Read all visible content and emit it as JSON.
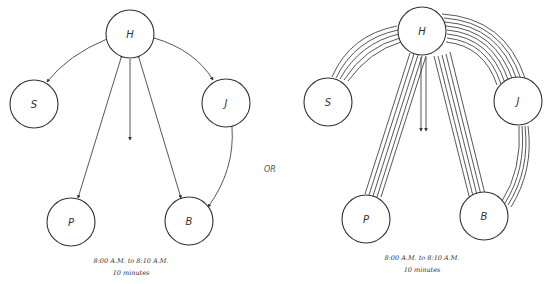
{
  "separator_label": "OR",
  "diagrams": [
    {
      "id": "left",
      "nodes": [
        {
          "id": "H",
          "label": "H"
        },
        {
          "id": "S",
          "label": "S"
        },
        {
          "id": "J",
          "label": "J"
        },
        {
          "id": "P",
          "label": "P"
        },
        {
          "id": "B",
          "label": "B"
        }
      ],
      "edges": [
        {
          "from": "H",
          "to": "S",
          "lines": 1
        },
        {
          "from": "H",
          "to": "J",
          "lines": 1
        },
        {
          "from": "H",
          "to": "P",
          "lines": 1
        },
        {
          "from": "H",
          "to": "B",
          "lines": 1
        },
        {
          "from": "J",
          "to": "B",
          "lines": 1
        },
        {
          "from": "H",
          "to": "down",
          "lines": 1
        }
      ],
      "caption": {
        "time_range": "8:00 A.M. to 8:10 A.M.",
        "duration": "10 minutes"
      }
    },
    {
      "id": "right",
      "nodes": [
        {
          "id": "H",
          "label": "H"
        },
        {
          "id": "S",
          "label": "S"
        },
        {
          "id": "J",
          "label": "J"
        },
        {
          "id": "P",
          "label": "P"
        },
        {
          "id": "B",
          "label": "B"
        }
      ],
      "edges": [
        {
          "from": "H",
          "to": "S",
          "lines": 5
        },
        {
          "from": "H",
          "to": "J",
          "lines": 8
        },
        {
          "from": "H",
          "to": "P",
          "lines": 5
        },
        {
          "from": "H",
          "to": "B",
          "lines": 5
        },
        {
          "from": "J",
          "to": "B",
          "lines": 4
        },
        {
          "from": "H",
          "to": "down",
          "lines": 2
        }
      ],
      "caption": {
        "time_range": "8:00 A.M. to 8:10 A.M.",
        "duration": "10 minutes"
      }
    }
  ]
}
